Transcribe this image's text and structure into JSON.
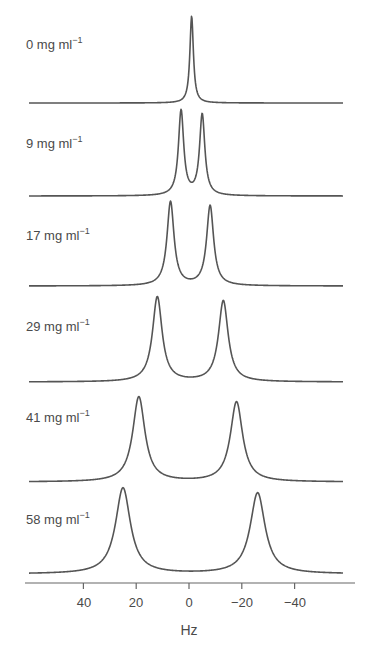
{
  "chart_data": {
    "type": "line",
    "title": "",
    "xlabel": "Hz",
    "ylabel": "",
    "x_axis": {
      "reversed": true,
      "ticks": [
        40,
        20,
        0,
        -20,
        -40
      ],
      "tick_labels": [
        "40",
        "20",
        "0",
        "−20",
        "−40"
      ],
      "range": [
        62,
        -63
      ]
    },
    "grid": false,
    "legend": "none (labels placed left of each stacked trace)",
    "layout": "stacked spectra, one trace per concentration, baselines offset vertically",
    "series": [
      {
        "name": "0 mg ml⁻¹",
        "label_main": "0 mg ml",
        "label_sup": "−1",
        "peaks_hz": [
          -1
        ],
        "peak_heights_rel": [
          1.0
        ],
        "linewidth_hz": 0.8
      },
      {
        "name": "9 mg ml⁻¹",
        "label_main": "9 mg ml",
        "label_sup": "−1",
        "peaks_hz": [
          3,
          -5
        ],
        "peak_heights_rel": [
          1.0,
          0.98
        ],
        "linewidth_hz": 1.2
      },
      {
        "name": "17 mg ml⁻¹",
        "label_main": "17 mg ml",
        "label_sup": "−1",
        "peaks_hz": [
          7,
          -8
        ],
        "peak_heights_rel": [
          1.0,
          0.95
        ],
        "linewidth_hz": 1.6
      },
      {
        "name": "29 mg ml⁻¹",
        "label_main": "29 mg ml",
        "label_sup": "−1",
        "peaks_hz": [
          12,
          -13
        ],
        "peak_heights_rel": [
          1.0,
          0.95
        ],
        "linewidth_hz": 2.2
      },
      {
        "name": "41 mg ml⁻¹",
        "label_main": "41 mg ml",
        "label_sup": "−1",
        "peaks_hz": [
          19,
          -18
        ],
        "peak_heights_rel": [
          1.0,
          0.94
        ],
        "linewidth_hz": 2.8
      },
      {
        "name": "58 mg ml⁻¹",
        "label_main": "58 mg ml",
        "label_sup": "−1",
        "peaks_hz": [
          25,
          -26
        ],
        "peak_heights_rel": [
          1.0,
          0.94
        ],
        "linewidth_hz": 3.4
      }
    ]
  },
  "render": {
    "line_color": "#555555",
    "axis_color": "#666666",
    "px_per_hz": 2.64,
    "zero_x": 189,
    "trace_x_start": 29,
    "trace_x_end": 343,
    "traces": [
      {
        "baseline_y": 103,
        "peak_top_y": [
          16
        ],
        "label_y": 93
      },
      {
        "baseline_y": 196,
        "peak_top_y": [
          111,
          115
        ],
        "label_y": 186
      },
      {
        "baseline_y": 286,
        "peak_top_y": [
          202,
          206
        ],
        "label_y": 276
      },
      {
        "baseline_y": 382,
        "peak_top_y": [
          297,
          301
        ],
        "label_y": 372
      },
      {
        "baseline_y": 482,
        "peak_top_y": [
          397,
          402
        ],
        "label_y": 472
      },
      {
        "baseline_y": 574,
        "peak_top_y": [
          488,
          493
        ],
        "label_y": 564
      }
    ],
    "axis_y": 583,
    "axis_x_start": 25,
    "axis_x_end": 355
  }
}
